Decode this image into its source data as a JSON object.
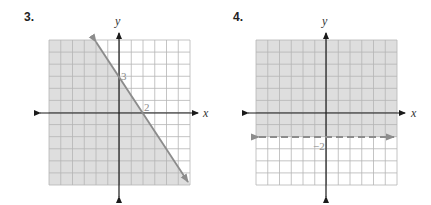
{
  "problems": [
    {
      "number": "3.",
      "x_axis_label": "x",
      "y_axis_label": "y",
      "boundary": {
        "equation": "y = -3/2 x + 3",
        "style": "solid",
        "points": [
          [
            0,
            3
          ],
          [
            2,
            0
          ]
        ],
        "labels": [
          {
            "text": "3",
            "at": [
              0,
              3
            ],
            "description": "y-intercept"
          },
          {
            "text": "2",
            "at": [
              2,
              0
            ],
            "description": "x-intercept"
          }
        ]
      },
      "shaded_region": "below-left of line (y <= -3/2 x + 3)",
      "grid_range": {
        "x": [
          -6,
          6
        ],
        "y": [
          -6,
          6
        ]
      }
    },
    {
      "number": "4.",
      "x_axis_label": "x",
      "y_axis_label": "y",
      "boundary": {
        "equation": "y = -2",
        "style": "dashed",
        "points": [
          [
            -6,
            -2
          ],
          [
            6,
            -2
          ]
        ],
        "labels": [
          {
            "text": "−2",
            "at": [
              0,
              -2
            ],
            "description": "y-intercept"
          }
        ]
      },
      "shaded_region": "above line (y > -2)",
      "grid_range": {
        "x": [
          -6,
          6
        ],
        "y": [
          -6,
          6
        ]
      }
    }
  ],
  "colors": {
    "shade": "#dedede",
    "grid": "#b5b5b5",
    "axis": "#1a1a1a",
    "boundary_line": "#8c8c8c",
    "tick_label": "#8a8a8a"
  }
}
